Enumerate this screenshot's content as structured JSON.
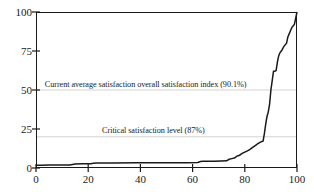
{
  "chart_data": {
    "type": "line",
    "title": "",
    "subtitle": "",
    "xlabel": "",
    "ylabel": "",
    "xlim": [
      0,
      100
    ],
    "ylim": [
      0,
      100
    ],
    "grid": true,
    "grid_values": [
      20,
      50
    ],
    "legend": "none",
    "xticks": [
      0,
      20,
      40,
      60,
      80,
      100
    ],
    "yticks": [
      0,
      25,
      50,
      75,
      100
    ],
    "series": [
      {
        "name": "Cumulative satisfaction distribution",
        "color": "#1a1a1a",
        "x": [
          0,
          2,
          5,
          9,
          13,
          14,
          15,
          18,
          21,
          22,
          23,
          30,
          38,
          45,
          52,
          58,
          62,
          63,
          64,
          68,
          71,
          73,
          74,
          75,
          76,
          77,
          78,
          79,
          80,
          81,
          82,
          83,
          84,
          85,
          86,
          86.5,
          87,
          87.5,
          88,
          88.5,
          89,
          89.5,
          90,
          90.5,
          91,
          91.5,
          92,
          92.5,
          93,
          93.5,
          94,
          95,
          96,
          96.5,
          97,
          97.5,
          98,
          98.5,
          99,
          99.5,
          100
        ],
        "y": [
          1.8,
          1.8,
          1.9,
          2.0,
          2.0,
          2.3,
          2.6,
          2.7,
          2.8,
          3.1,
          3.2,
          3.2,
          3.3,
          3.3,
          3.4,
          3.4,
          3.5,
          4.2,
          4.3,
          4.4,
          4.5,
          4.6,
          5.6,
          6.0,
          6.4,
          7.6,
          8.2,
          9.4,
          10.2,
          11.0,
          12.0,
          13.2,
          14.4,
          15.6,
          16.6,
          17.0,
          17.2,
          22.0,
          28.0,
          33.0,
          36.0,
          41.0,
          50.0,
          56.0,
          62.0,
          62.0,
          62.5,
          68.0,
          72.0,
          74.0,
          75.0,
          78.0,
          80.0,
          84.0,
          86.0,
          88.0,
          90.0,
          91.0,
          92.0,
          96.0,
          100.0
        ]
      }
    ],
    "annotations": [
      {
        "id": "average-satisfaction",
        "text": "Current average satisfaction overall satisfaction index (90.1%)",
        "x_value": 42,
        "y_value": 53
      },
      {
        "id": "critical-satisfaction",
        "text": "Critical satisfaction level (87%)",
        "x_value": 45,
        "y_value": 24
      }
    ]
  }
}
